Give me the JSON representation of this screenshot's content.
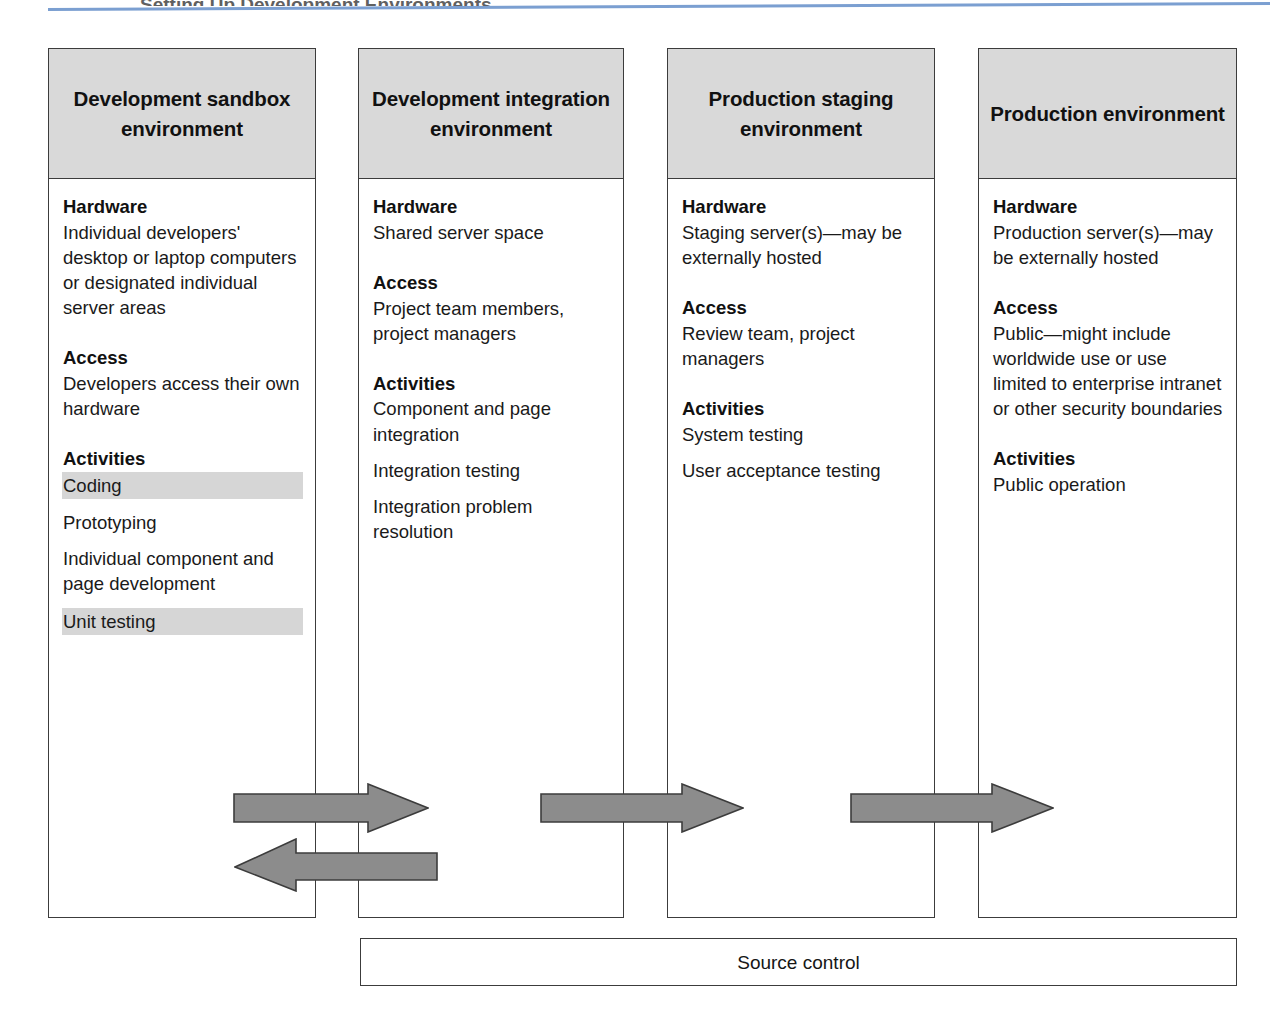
{
  "page": {
    "header_ghost_text": "Setting Up Development Environments",
    "accent_rule_color": "#7b9fd1",
    "header_fill_color": "#d9d9d9",
    "highlight_color": "#d6d6d6",
    "arrow_fill_color": "#8c8c8c",
    "border_color": "#3c3c3c"
  },
  "columns": [
    {
      "title": "Development sandbox environment",
      "sections": [
        {
          "title": "Hardware",
          "lines": [
            {
              "text": "Individual developers' desktop or laptop computers or designated individual server areas",
              "highlight": false,
              "spaced": false
            }
          ]
        },
        {
          "title": "Access",
          "lines": [
            {
              "text": "Developers access their own hardware",
              "highlight": false,
              "spaced": false
            }
          ]
        },
        {
          "title": "Activities",
          "lines": [
            {
              "text": "Coding",
              "highlight": true,
              "spaced": false
            },
            {
              "text": "Prototyping",
              "highlight": false,
              "spaced": true
            },
            {
              "text": "Individual component and page development",
              "highlight": false,
              "spaced": true
            },
            {
              "text": "Unit testing",
              "highlight": true,
              "spaced": true
            }
          ]
        }
      ]
    },
    {
      "title": "Development integration environment",
      "sections": [
        {
          "title": "Hardware",
          "lines": [
            {
              "text": "Shared server space",
              "highlight": false,
              "spaced": false
            }
          ]
        },
        {
          "title": "Access",
          "lines": [
            {
              "text": "Project team members, project managers",
              "highlight": false,
              "spaced": false
            }
          ]
        },
        {
          "title": "Activities",
          "lines": [
            {
              "text": "Component and page integration",
              "highlight": false,
              "spaced": false
            },
            {
              "text": "Integration testing",
              "highlight": false,
              "spaced": true
            },
            {
              "text": "Integration problem resolution",
              "highlight": false,
              "spaced": true
            }
          ]
        }
      ]
    },
    {
      "title": "Production staging environment",
      "sections": [
        {
          "title": "Hardware",
          "lines": [
            {
              "text": "Staging server(s)—may be externally hosted",
              "highlight": false,
              "spaced": false
            }
          ]
        },
        {
          "title": "Access",
          "lines": [
            {
              "text": "Review team, project managers",
              "highlight": false,
              "spaced": false
            }
          ]
        },
        {
          "title": "Activities",
          "lines": [
            {
              "text": "System testing",
              "highlight": false,
              "spaced": false
            },
            {
              "text": "User acceptance testing",
              "highlight": false,
              "spaced": true
            }
          ]
        }
      ]
    },
    {
      "title": "Production environment",
      "sections": [
        {
          "title": "Hardware",
          "lines": [
            {
              "text": "Production server(s)—may be externally hosted",
              "highlight": false,
              "spaced": false
            }
          ]
        },
        {
          "title": "Access",
          "lines": [
            {
              "text": "Public—might include worldwide use or use limited to enterprise intranet or other security boundaries",
              "highlight": false,
              "spaced": false
            }
          ]
        },
        {
          "title": "Activities",
          "lines": [
            {
              "text": "Public operation",
              "highlight": false,
              "spaced": false
            }
          ]
        }
      ]
    }
  ],
  "arrows": [
    {
      "name": "sandbox-to-integration",
      "direction": "right"
    },
    {
      "name": "integration-to-sandbox",
      "direction": "left"
    },
    {
      "name": "integration-to-staging",
      "direction": "right"
    },
    {
      "name": "staging-to-production",
      "direction": "right"
    }
  ],
  "source_control": {
    "label": "Source control"
  }
}
